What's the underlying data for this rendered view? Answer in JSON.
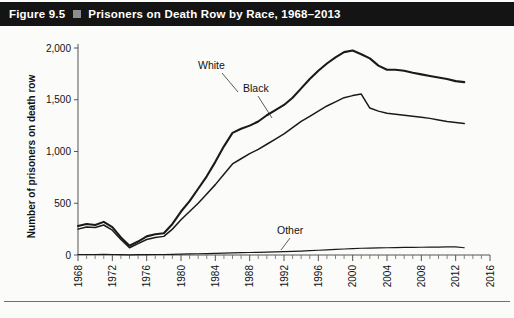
{
  "figure": {
    "number": "Figure 9.5",
    "bullet": "square-bullet",
    "title": "Prisoners on Death Row by Race, 1968–2013"
  },
  "colors": {
    "title_bar_background": "#141414",
    "title_text": "#ffffff",
    "bullet": "#8d8d8d",
    "plot_background": "#fbfbf9",
    "line": "#1a1a1a",
    "axis": "#555555"
  },
  "chart_data": {
    "type": "line",
    "title": "Prisoners on Death Row by Race, 1968–2013",
    "xlabel": "",
    "ylabel": "Number of prisoners on death row",
    "xlim": [
      1968,
      2016
    ],
    "ylim": [
      0,
      2000
    ],
    "yticks": [
      0,
      500,
      1000,
      1500,
      2000
    ],
    "ytick_labels": [
      "0",
      "500",
      "1,000",
      "1,500",
      "2,000"
    ],
    "xticks": [
      1968,
      1972,
      1976,
      1980,
      1984,
      1988,
      1992,
      1996,
      2000,
      2004,
      2008,
      2012,
      2016
    ],
    "xtick_labels": [
      "1968",
      "1972",
      "1976",
      "1980",
      "1984",
      "1988",
      "1992",
      "1996",
      "2000",
      "2004",
      "2008",
      "2012",
      "2016"
    ],
    "x_minor_tick_interval": 1,
    "grid": false,
    "legend": "inline-labels",
    "x": [
      1968,
      1969,
      1970,
      1971,
      1972,
      1973,
      1974,
      1975,
      1976,
      1977,
      1978,
      1979,
      1980,
      1981,
      1982,
      1983,
      1984,
      1985,
      1986,
      1987,
      1988,
      1989,
      1990,
      1991,
      1992,
      1993,
      1994,
      1995,
      1996,
      1997,
      1998,
      1999,
      2000,
      2001,
      2002,
      2003,
      2004,
      2005,
      2006,
      2007,
      2008,
      2009,
      2010,
      2011,
      2012,
      2013
    ],
    "series": [
      {
        "name": "White",
        "label": "White",
        "values": [
          280,
          300,
          290,
          320,
          270,
          170,
          90,
          130,
          180,
          200,
          210,
          300,
          420,
          520,
          640,
          760,
          900,
          1050,
          1180,
          1220,
          1250,
          1290,
          1350,
          1400,
          1450,
          1520,
          1610,
          1700,
          1780,
          1850,
          1910,
          1960,
          1975,
          1940,
          1900,
          1830,
          1790,
          1790,
          1780,
          1760,
          1745,
          1730,
          1715,
          1700,
          1680,
          1670
        ]
      },
      {
        "name": "Black",
        "label": "Black",
        "values": [
          250,
          270,
          265,
          290,
          240,
          150,
          70,
          110,
          150,
          170,
          180,
          250,
          340,
          420,
          500,
          590,
          680,
          780,
          880,
          930,
          980,
          1020,
          1070,
          1120,
          1170,
          1230,
          1290,
          1340,
          1390,
          1440,
          1480,
          1520,
          1540,
          1555,
          1420,
          1390,
          1370,
          1360,
          1350,
          1340,
          1330,
          1320,
          1305,
          1290,
          1280,
          1270
        ]
      },
      {
        "name": "Other",
        "label": "Other",
        "values": [
          5,
          5,
          5,
          6,
          5,
          4,
          2,
          3,
          4,
          5,
          5,
          6,
          8,
          10,
          12,
          14,
          16,
          18,
          20,
          22,
          24,
          26,
          28,
          30,
          32,
          35,
          38,
          42,
          46,
          50,
          54,
          58,
          62,
          65,
          66,
          68,
          70,
          72,
          73,
          74,
          75,
          76,
          77,
          78,
          78,
          70
        ]
      }
    ],
    "annotations": [
      {
        "text": "White",
        "series": "White",
        "year": 1994
      },
      {
        "text": "Black",
        "series": "Black",
        "year": 1998
      },
      {
        "text": "Other",
        "series": "Other",
        "year": 2001
      }
    ]
  }
}
